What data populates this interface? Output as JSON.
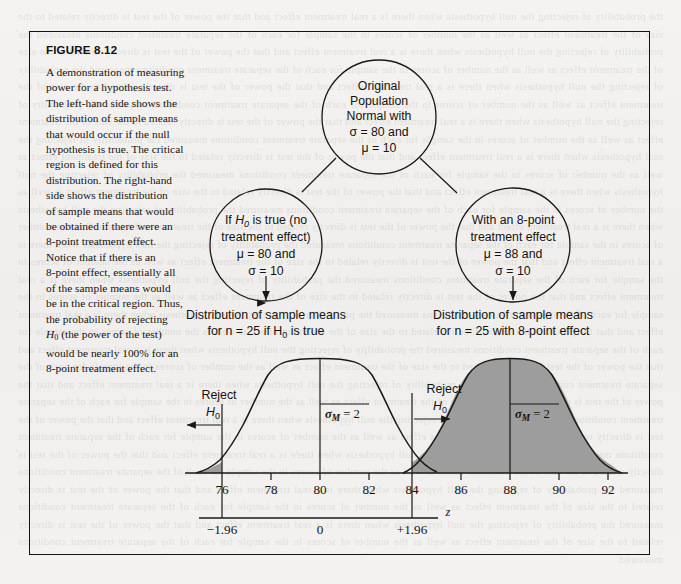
{
  "figure": {
    "label": "FIGURE 8.12",
    "caption_lines": [
      "A demonstration of measuring",
      "power for a hypothesis test.",
      "The left-hand side shows the",
      "distribution of sample means",
      "that would occur if the null",
      "hypothesis is true. The critical",
      "region is defined for this",
      "distribution. The right-hand",
      "side shows the distribution",
      "of sample means that would",
      "be obtained if there were an",
      "8-point treatment effect.",
      "Notice that if there is an",
      "8-point effect, essentially all",
      "of the sample means would",
      "be in the critical region. Thus,",
      "the probability of rejecting",
      "H0 (the power of the test)",
      "would be nearly 100% for an",
      "8-point treatment effect."
    ]
  },
  "nodes": {
    "population": {
      "id": "original-population",
      "lines": [
        "Original",
        "Population",
        "Normal with",
        "σ = 80 and",
        "μ = 10"
      ]
    },
    "null_hypothesis": {
      "id": "null-hypothesis-node",
      "lines": [
        "If H0 is true (no",
        "treatment effect)",
        "μ = 80 and",
        "σ = 10"
      ]
    },
    "treatment_effect": {
      "id": "treatment-effect-node",
      "lines": [
        "With an 8-point",
        "treatment effect",
        "μ = 88 and",
        "σ = 10"
      ]
    }
  },
  "distribution_captions": {
    "left": [
      "Distribution of sample means",
      "for n = 25 if H0 is true"
    ],
    "right": [
      "Distribution of sample means",
      "for n = 25 with 8-point effect"
    ]
  },
  "chart_data": {
    "type": "line",
    "xlabel": "",
    "ylabel": "",
    "xlim": [
      74.5,
      93.5
    ],
    "grid": false,
    "legend": "none",
    "primary_axis": {
      "name": "sample mean (M)",
      "ticks": [
        76,
        78,
        80,
        82,
        84,
        86,
        88,
        90,
        92
      ],
      "tick_labels": [
        "76",
        "78",
        "80",
        "82",
        "84",
        "86",
        "88",
        "90",
        "92"
      ]
    },
    "secondary_axis": {
      "name": "z",
      "label": "z",
      "ticks": [
        -1.96,
        0,
        1.96
      ],
      "tick_labels": [
        "−1.96",
        "0",
        "+1.96"
      ]
    },
    "series": [
      {
        "name": "Distribution of sample means for n = 25 if H0 is true",
        "mean": 80,
        "sem": 2,
        "sem_label": "σM = 2",
        "shaded": "tails beyond critical values",
        "fill_color": "#9d9d9d",
        "line_color": "#1a1814"
      },
      {
        "name": "Distribution of sample means for n = 25 with 8-point effect",
        "mean": 88,
        "sem": 2,
        "sem_label": "σM = 2",
        "shaded": "entire distribution beyond critical value (power)",
        "fill_color": "#9d9d9d",
        "line_color": "#1a1814"
      }
    ],
    "critical_values": [
      {
        "m": 76.08,
        "z": -1.96,
        "label": "−1.96"
      },
      {
        "m": 83.92,
        "z": 1.96,
        "label": "+1.96"
      }
    ],
    "annotations": [
      {
        "id": "reject-left",
        "text_lines": [
          "Reject",
          "H0"
        ],
        "arrow": "left",
        "at_m": 76.08
      },
      {
        "id": "reject-right",
        "text_lines": [
          "Reject",
          "H0"
        ],
        "arrow": "right",
        "at_m": 83.92
      },
      {
        "id": "sigma-m-left",
        "text": "σM = 2",
        "at_m": 80
      },
      {
        "id": "sigma-m-right",
        "text": "σM = 2",
        "at_m": 88
      }
    ]
  },
  "colors": {
    "page_background": "#f2f1ef",
    "ink": "#15130f",
    "shade_fill": "#9d9d9d",
    "border": "#15130f"
  },
  "bleed_text": "the probability of rejecting the null hypothesis when there is a real treatment effect and that the power of the test is directly related to the size of the treatment effect as well as the number of scores in the sample for each of the separate treatment conditions measured"
}
